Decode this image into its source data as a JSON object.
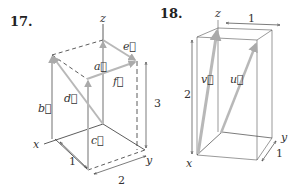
{
  "figures": [
    {
      "number": "17.",
      "axes": {
        "x": "x",
        "y": "y",
        "z": "z"
      },
      "vectors": [
        "a",
        "b",
        "c",
        "d",
        "e",
        "f"
      ],
      "dimensions": {
        "x": "1",
        "y": "2",
        "z": "3"
      }
    },
    {
      "number": "18.",
      "axes": {
        "x": "x",
        "y": "y",
        "z": "z"
      },
      "vectors": [
        "u",
        "v"
      ],
      "dimensions": {
        "x": "1",
        "y": "1",
        "z": "2"
      }
    }
  ],
  "colors": {
    "vector": "#b8b8b8",
    "edge": "#333333",
    "dim": "#555555"
  }
}
